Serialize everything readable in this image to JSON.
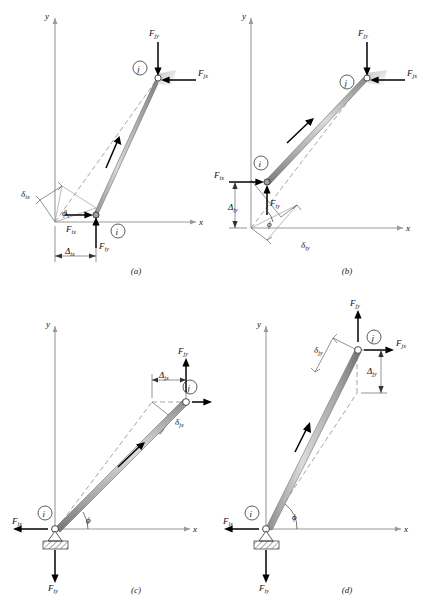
{
  "figure": {
    "type": "engineering-free-body-diagram",
    "axis_x_label": "x",
    "axis_y_label": "y",
    "angle_label": "ϕ",
    "colors": {
      "member_fill_light": "#e8e8e8",
      "member_fill_dark": "#9a9a9a",
      "axis_gray": "#9a9a9a",
      "force_black": "#000000",
      "dash_gray": "#7d7d7d"
    },
    "panels": [
      {
        "id": "a",
        "caption": "(a)",
        "node_i": "i",
        "node_j": "j",
        "forces": [
          {
            "name": "F_ix",
            "base": "F",
            "sub": "ix",
            "direction": "right"
          },
          {
            "name": "F_iy",
            "base": "F",
            "sub": "iy",
            "direction": "up"
          },
          {
            "name": "F_jx",
            "base": "F",
            "sub": "jx",
            "direction": "left"
          },
          {
            "name": "F_jy",
            "base": "F",
            "sub": "jy",
            "direction": "down"
          }
        ],
        "displacement": {
          "base": "Δ",
          "sub": "ix",
          "orientation": "horizontal"
        },
        "deformation": {
          "base": "δ",
          "sub": "ix",
          "orientation": "along-member"
        },
        "angle": "ϕ"
      },
      {
        "id": "b",
        "caption": "(b)",
        "node_i": "i",
        "node_j": "j",
        "forces": [
          {
            "name": "F_ix",
            "base": "F",
            "sub": "ix",
            "direction": "right"
          },
          {
            "name": "F_iy",
            "base": "F",
            "sub": "iy",
            "direction": "up"
          },
          {
            "name": "F_jx",
            "base": "F",
            "sub": "jx",
            "direction": "left"
          },
          {
            "name": "F_jy",
            "base": "F",
            "sub": "jy",
            "direction": "down"
          }
        ],
        "displacement": {
          "base": "Δ",
          "sub": "iy",
          "orientation": "vertical"
        },
        "deformation": {
          "base": "δ",
          "sub": "iy",
          "orientation": "along-member"
        },
        "angle": "ϕ"
      },
      {
        "id": "c",
        "caption": "(c)",
        "node_i": "i",
        "node_j": "j",
        "support": "pinned-hatched",
        "forces": [
          {
            "name": "F_ix",
            "base": "F",
            "sub": "ix",
            "direction": "left"
          },
          {
            "name": "F_iy",
            "base": "F",
            "sub": "iy",
            "direction": "down"
          },
          {
            "name": "F_jx",
            "base": "F",
            "sub": "jx",
            "direction": "right"
          },
          {
            "name": "F_jy",
            "base": "F",
            "sub": "jy",
            "direction": "up"
          }
        ],
        "displacement": {
          "base": "Δ",
          "sub": "jx",
          "orientation": "horizontal"
        },
        "deformation": {
          "base": "δ",
          "sub": "jx",
          "orientation": "along-member"
        },
        "angle": "ϕ"
      },
      {
        "id": "d",
        "caption": "(d)",
        "node_i": "i",
        "node_j": "j",
        "support": "pinned-hatched",
        "forces": [
          {
            "name": "F_ix",
            "base": "F",
            "sub": "ix",
            "direction": "left"
          },
          {
            "name": "F_iy",
            "base": "F",
            "sub": "iy",
            "direction": "down"
          },
          {
            "name": "F_jx",
            "base": "F",
            "sub": "jx",
            "direction": "right"
          },
          {
            "name": "F_jy",
            "base": "F",
            "sub": "jy",
            "direction": "up"
          }
        ],
        "displacement": {
          "base": "Δ",
          "sub": "jy",
          "orientation": "vertical"
        },
        "deformation": {
          "base": "δ",
          "sub": "jy",
          "orientation": "along-member"
        },
        "angle": "ϕ"
      }
    ]
  }
}
